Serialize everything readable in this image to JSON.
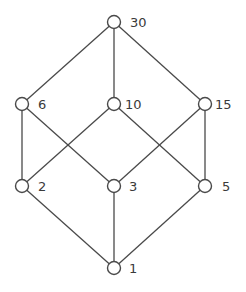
{
  "diagram": {
    "type": "hasse-diagram",
    "nodes": [
      {
        "id": "30",
        "label": "30",
        "x": 114,
        "y": 22,
        "lx": 130,
        "ly": 27
      },
      {
        "id": "6",
        "label": "6",
        "x": 22,
        "y": 104,
        "lx": 38,
        "ly": 109
      },
      {
        "id": "10",
        "label": "10",
        "x": 114,
        "y": 104,
        "lx": 125,
        "ly": 109
      },
      {
        "id": "15",
        "label": "15",
        "x": 205,
        "y": 104,
        "lx": 215,
        "ly": 109
      },
      {
        "id": "2",
        "label": "2",
        "x": 22,
        "y": 186,
        "lx": 38,
        "ly": 191
      },
      {
        "id": "3",
        "label": "3",
        "x": 114,
        "y": 186,
        "lx": 129,
        "ly": 191
      },
      {
        "id": "5",
        "label": "5",
        "x": 205,
        "y": 186,
        "lx": 222,
        "ly": 191
      },
      {
        "id": "1",
        "label": "1",
        "x": 114,
        "y": 268,
        "lx": 129,
        "ly": 273
      }
    ],
    "edges": [
      [
        "30",
        "6"
      ],
      [
        "30",
        "10"
      ],
      [
        "30",
        "15"
      ],
      [
        "6",
        "2"
      ],
      [
        "6",
        "3"
      ],
      [
        "10",
        "2"
      ],
      [
        "10",
        "5"
      ],
      [
        "15",
        "3"
      ],
      [
        "15",
        "5"
      ],
      [
        "2",
        "1"
      ],
      [
        "3",
        "1"
      ],
      [
        "5",
        "1"
      ]
    ]
  }
}
